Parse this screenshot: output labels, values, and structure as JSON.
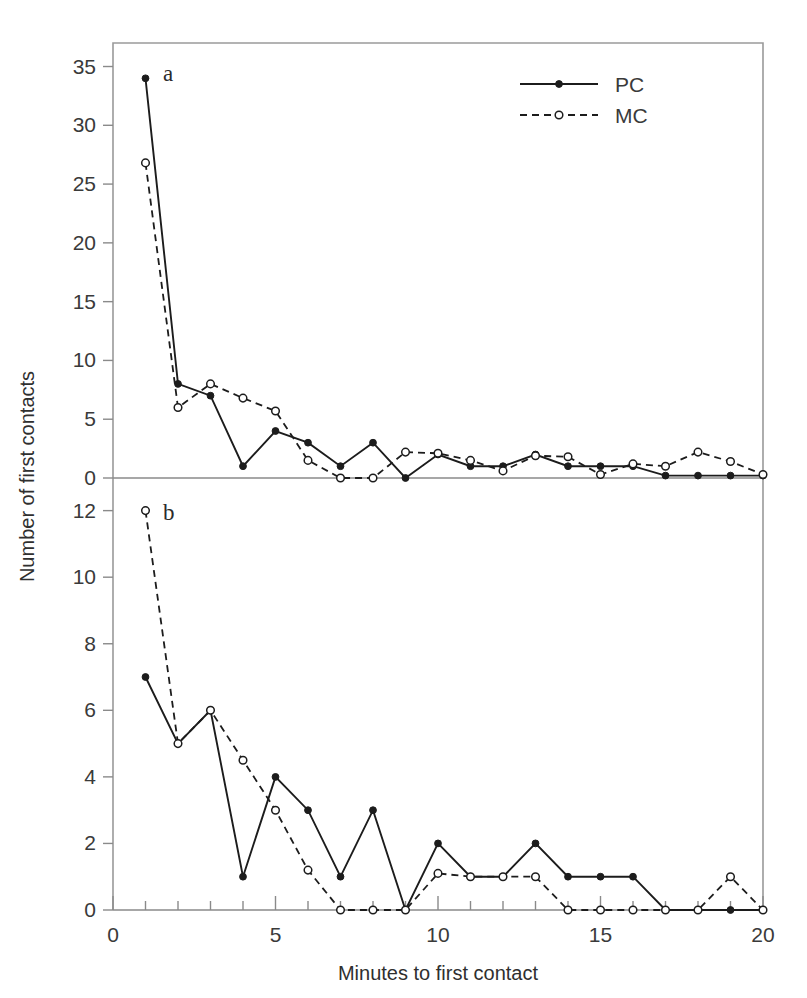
{
  "figure": {
    "xlabel": "Minutes to first contact",
    "ylabel": "Number of first contacts",
    "panel_a_label": "a",
    "panel_b_label": "b",
    "legend": [
      {
        "key": "PC",
        "label": "PC",
        "style": "solid-line-filled-circle"
      },
      {
        "key": "MC",
        "label": "MC",
        "style": "dashed-line-open-circle"
      }
    ],
    "x_ticks": [
      "0",
      "5",
      "10",
      "15",
      "20"
    ],
    "panel_a_y_ticks": [
      "0",
      "5",
      "10",
      "15",
      "20",
      "25",
      "30",
      "35"
    ],
    "panel_b_y_ticks": [
      "0",
      "2",
      "4",
      "6",
      "8",
      "10",
      "12"
    ],
    "line_color": "#1c1c1c",
    "axis_color": "#8a8a8a"
  },
  "chart_data": [
    {
      "type": "line",
      "panel": "a",
      "title": "a",
      "xlabel": "Minutes to first contact",
      "ylabel": "Number of first contacts",
      "x": [
        1,
        2,
        3,
        4,
        5,
        6,
        7,
        8,
        9,
        10,
        11,
        12,
        13,
        14,
        15,
        16,
        17,
        18,
        19,
        20
      ],
      "xlim": [
        0,
        20
      ],
      "ylim": [
        0,
        37
      ],
      "y_ticks": [
        0,
        5,
        10,
        15,
        20,
        25,
        30,
        35
      ],
      "x_ticks": [
        0,
        5,
        10,
        15,
        20
      ],
      "x_minor_tick_step": 1,
      "grid": false,
      "legend_position": "top-right",
      "series": [
        {
          "name": "PC",
          "marker": "filled-circle",
          "line": "solid",
          "values": [
            34,
            8,
            7,
            1,
            4,
            3,
            1,
            3,
            0,
            2,
            1,
            1,
            2,
            1,
            1,
            1,
            0.2,
            0.2,
            0.2,
            0.2
          ]
        },
        {
          "name": "MC",
          "marker": "open-circle",
          "line": "dashed",
          "values": [
            26.8,
            6,
            8,
            6.8,
            5.7,
            1.5,
            0,
            0,
            2.2,
            2.1,
            1.5,
            0.6,
            1.9,
            1.8,
            0.3,
            1.2,
            1.0,
            2.2,
            1.4,
            0.3
          ]
        }
      ]
    },
    {
      "type": "line",
      "panel": "b",
      "title": "b",
      "xlabel": "Minutes to first contact",
      "ylabel": "Number of first contacts",
      "x": [
        1,
        2,
        3,
        4,
        5,
        6,
        7,
        8,
        9,
        10,
        11,
        12,
        13,
        14,
        15,
        16,
        17,
        18,
        19,
        20
      ],
      "xlim": [
        0,
        20
      ],
      "ylim": [
        0,
        12.8
      ],
      "y_ticks": [
        0,
        2,
        4,
        6,
        8,
        10,
        12
      ],
      "x_ticks": [
        0,
        5,
        10,
        15,
        20
      ],
      "x_minor_tick_step": 1,
      "grid": false,
      "legend_position": "none",
      "series": [
        {
          "name": "PC",
          "marker": "filled-circle",
          "line": "solid",
          "values": [
            7,
            5,
            6,
            1,
            4,
            3,
            1,
            3,
            0,
            2,
            1,
            1,
            2,
            1,
            1,
            1,
            0,
            0,
            0,
            0
          ]
        },
        {
          "name": "MC",
          "marker": "open-circle",
          "line": "dashed",
          "values": [
            12,
            5,
            6,
            4.5,
            3,
            1.2,
            0,
            0,
            0,
            1.1,
            1,
            1,
            1,
            0,
            0,
            0,
            0,
            0,
            1,
            0
          ]
        }
      ]
    }
  ]
}
